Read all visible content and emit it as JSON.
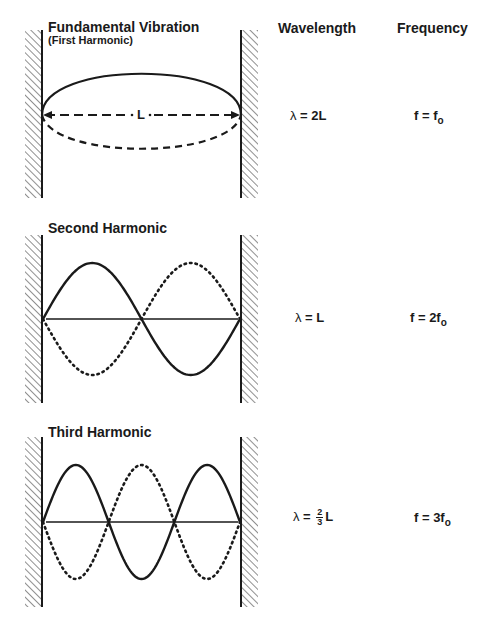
{
  "headers": {
    "wavelength": "Wavelength",
    "frequency": "Frequency"
  },
  "panels": [
    {
      "title": "Fundamental Vibration",
      "subtitle": "(First Harmonic)",
      "length_label": "L",
      "wavelength": {
        "lambda": "λ",
        "eq": " = 2L"
      },
      "frequency": {
        "prefix": "f = f",
        "sub": "o"
      }
    },
    {
      "title": "Second Harmonic",
      "wavelength": {
        "lambda": "λ",
        "eq": " = L"
      },
      "frequency": {
        "prefix": "f = 2f",
        "sub": "o"
      }
    },
    {
      "title": "Third Harmonic",
      "wavelength": {
        "lambda": "λ",
        "eq": " = ",
        "num": "2",
        "den": "3",
        "suffix": "L"
      },
      "frequency": {
        "prefix": "f = 3f",
        "sub": "o"
      }
    }
  ],
  "colors": {
    "ink": "#1a1a1a",
    "background": "#ffffff"
  }
}
